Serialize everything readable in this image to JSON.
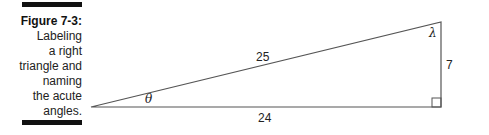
{
  "figure": {
    "label": "Figure 7-3:",
    "caption_lines": [
      "Labeling",
      "a right",
      "triangle and",
      "naming",
      "the acute",
      "angles."
    ]
  },
  "triangle": {
    "hypotenuse": "25",
    "adjacent": "24",
    "opposite": "7",
    "angle_left": "θ",
    "angle_top": "λ",
    "right_angle_marker": true
  }
}
